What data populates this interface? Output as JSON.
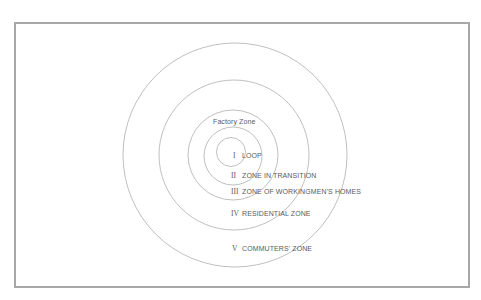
{
  "diagram": {
    "factory_zone_label": "Factory Zone",
    "zones": [
      {
        "numeral": "I",
        "label": "LOOP"
      },
      {
        "numeral": "II",
        "label": "ZONE IN TRANSITION"
      },
      {
        "numeral": "III",
        "label": "ZONE OF WORKINGMEN'S HOMES"
      },
      {
        "numeral": "IV",
        "label": "RESIDENTIAL ZONE"
      },
      {
        "numeral": "V",
        "label": "COMMUTERS' ZONE"
      }
    ],
    "colors": {
      "frame": "#a8a8a8",
      "rings": "#b4b4b4",
      "text": "#5a5a5a"
    }
  }
}
